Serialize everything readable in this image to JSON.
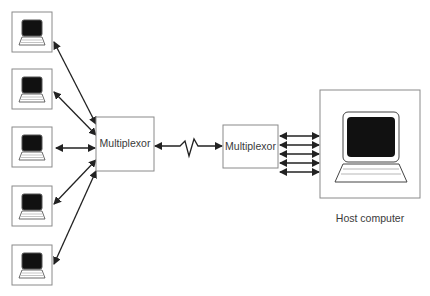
{
  "diagram": {
    "terminals": [
      {
        "id": "terminal-1"
      },
      {
        "id": "terminal-2"
      },
      {
        "id": "terminal-3"
      },
      {
        "id": "terminal-4"
      },
      {
        "id": "terminal-5"
      }
    ],
    "mux_left": {
      "label": "Multiplexor"
    },
    "mux_right": {
      "label": "Multiplexor"
    },
    "link": {
      "type": "communication line (bidirectional)"
    },
    "host": {
      "label": "Host computer"
    },
    "host_channels": 5,
    "colors": {
      "line": "#222222",
      "box_border": "#8a8a8a",
      "screen": "#111111"
    }
  }
}
